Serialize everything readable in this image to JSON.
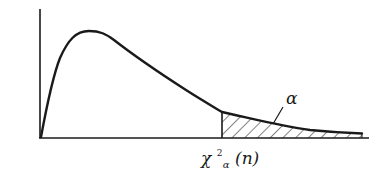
{
  "figure": {
    "alpha_label": "α",
    "critical_value_label": {
      "symbol": "χ",
      "superscript": "2",
      "subscript": "α",
      "argument": "(n)"
    },
    "colors": {
      "stroke": "#1a1a1a",
      "background": "#ffffff"
    }
  },
  "diagram": {
    "type": "density-curve",
    "axes": {
      "x_axis": true,
      "y_axis": true,
      "ticks": false
    },
    "shaded_region": {
      "side": "right",
      "pattern": "diagonal-hatch",
      "area_label": "α"
    }
  }
}
